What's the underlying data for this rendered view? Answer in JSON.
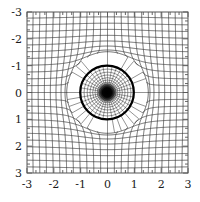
{
  "figure": {
    "kind": "conformal-map-plot",
    "background_color": "#ffffff",
    "frame_color": "#555555",
    "grid_color": "#3a3a3a",
    "circle_color": "#000000",
    "core_color": "#000000",
    "title": ""
  },
  "chart_data": {
    "type": "line",
    "title": "",
    "xlabel": "",
    "ylabel": "",
    "xlim": [
      -3,
      3
    ],
    "ylim": [
      -3,
      3
    ],
    "grid": true,
    "legend": null,
    "x_ticks": [
      -3,
      -2,
      -1,
      0,
      1,
      2,
      3
    ],
    "y_ticks": [
      -3,
      -2,
      -1,
      0,
      1,
      2,
      3
    ],
    "x_tick_labels": [
      "-3",
      "-2",
      "-1",
      "0",
      "1",
      "2",
      "3"
    ],
    "y_tick_labels": [
      "3",
      "2",
      "1",
      "0",
      "-1",
      "-2",
      "-3"
    ],
    "minor_ticks_per_interval": 2,
    "series": [
      {
        "name": "distorted-cartesian-grid",
        "description": "Image of a uniform Cartesian grid under an inversion-type conformal map; lines bend around the unit circle and crowd toward the origin",
        "grid_line_count_u": 25,
        "grid_line_count_v": 25,
        "grid_extent": [
          -3,
          3
        ]
      },
      {
        "name": "unit-circle",
        "description": "Thick black circle of radius 1 centred at the origin",
        "center": [
          0,
          0
        ],
        "radius": 1,
        "line_width_px": 2.2
      },
      {
        "name": "inner-polar-web",
        "description": "Radial and concentric arcs inside the unit circle converging to a dense dark blob at the origin",
        "center": [
          0,
          0
        ],
        "radial_spokes": 36,
        "concentric_rings": 18
      }
    ]
  },
  "axes": {
    "x": {
      "labels": [
        "-3",
        "-2",
        "-1",
        "0",
        "1",
        "2",
        "3"
      ],
      "values": [
        -3,
        -2,
        -1,
        0,
        1,
        2,
        3
      ]
    },
    "y": {
      "labels": [
        "3",
        "2",
        "1",
        "0",
        "-1",
        "-2",
        "-3"
      ],
      "values": [
        3,
        2,
        1,
        0,
        -1,
        -2,
        -3
      ]
    }
  }
}
